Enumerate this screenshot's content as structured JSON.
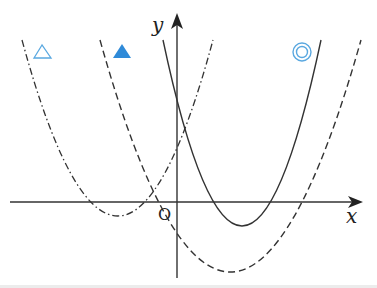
{
  "diagram": {
    "title": "",
    "axes": {
      "x_label": "x",
      "y_label": "y",
      "origin_label": "O",
      "x_axis": {
        "from": [
          10,
          202
        ],
        "to": [
          362,
          202
        ]
      },
      "y_axis": {
        "from": [
          177,
          278
        ],
        "to": [
          177,
          14
        ]
      }
    },
    "curves": [
      {
        "id": "solid",
        "style": "solid",
        "p0": [
          163,
          40
        ],
        "ctrl": [
          242,
          412
        ],
        "p2": [
          321,
          40
        ],
        "color": "#333333"
      },
      {
        "id": "dashed",
        "style": "dashed",
        "p0": [
          100,
          40
        ],
        "ctrl": [
          230,
          504
        ],
        "p2": [
          361,
          40
        ],
        "color": "#333333"
      },
      {
        "id": "dashdot",
        "style": "dash-dot",
        "p0": [
          22,
          40
        ],
        "ctrl": [
          118,
          392
        ],
        "p2": [
          213,
          40
        ],
        "color": "#333333"
      }
    ],
    "markers": [
      {
        "id": "triangle-outline",
        "symbol": "△",
        "x": 42,
        "y": 52,
        "color": "#5aa8e0"
      },
      {
        "id": "triangle-filled",
        "symbol": "▲",
        "x": 122,
        "y": 52,
        "color": "#2f8ad8"
      },
      {
        "id": "double-circle",
        "symbol": "◎",
        "x": 302,
        "y": 52,
        "color": "#5aa8e0"
      }
    ]
  }
}
